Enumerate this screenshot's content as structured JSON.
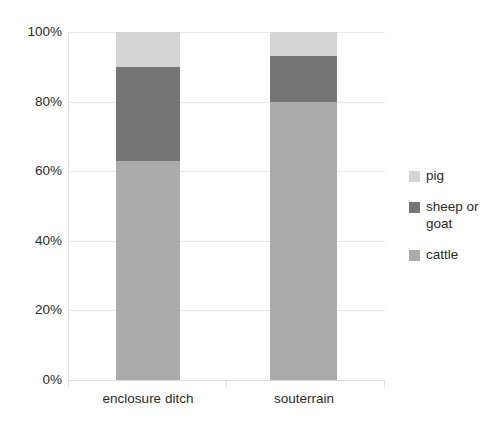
{
  "chart_data": {
    "type": "bar",
    "subtype": "stacked-percent",
    "title": "",
    "subtitle": "",
    "xlabel": "",
    "ylabel": "",
    "categories": [
      "enclosure ditch",
      "souterrain"
    ],
    "series": [
      {
        "name": "cattle",
        "values": [
          63,
          80
        ],
        "color": "#ababab"
      },
      {
        "name": "sheep or goat",
        "values": [
          27,
          13
        ],
        "color": "#757575"
      },
      {
        "name": "pig",
        "values": [
          10,
          7
        ],
        "color": "#d4d4d4"
      }
    ],
    "stack_order_bottom_to_top": [
      "cattle",
      "sheep or goat",
      "pig"
    ],
    "cumulative_tops": {
      "enclosure ditch": {
        "cattle": 63,
        "sheep or goat": 90,
        "pig": 100
      },
      "souterrain": {
        "cattle": 80,
        "sheep or goat": 93,
        "pig": 100
      }
    },
    "ylim": [
      0,
      100
    ],
    "y_ticks": [
      0,
      20,
      40,
      60,
      80,
      100
    ],
    "y_tick_labels": [
      "0%",
      "20%",
      "40%",
      "60%",
      "80%",
      "100%"
    ],
    "grid": true,
    "grid_axis": "y",
    "legend_position": "right",
    "legend_entries": [
      "pig",
      "sheep or goat",
      "cattle"
    ]
  },
  "axes": {
    "y_ticks": [
      {
        "label": "100%",
        "value": 100
      },
      {
        "label": "80%",
        "value": 80
      },
      {
        "label": "60%",
        "value": 60
      },
      {
        "label": "40%",
        "value": 40
      },
      {
        "label": "20%",
        "value": 20
      },
      {
        "label": "0%",
        "value": 0
      }
    ],
    "x_ticks": [
      {
        "label": "enclosure ditch"
      },
      {
        "label": "souterrain"
      }
    ]
  },
  "legend": {
    "items": [
      {
        "label": "pig",
        "color": "#d4d4d4"
      },
      {
        "label": "sheep or goat",
        "color": "#757575"
      },
      {
        "label": "cattle",
        "color": "#ababab"
      }
    ]
  },
  "colors": {
    "pig": "#d4d4d4",
    "sheep_or_goat": "#757575",
    "cattle": "#ababab",
    "gridline": "#e8e8e8",
    "axis": "#e0e0e0",
    "text": "#2b2b2b",
    "background": "#ffffff"
  }
}
